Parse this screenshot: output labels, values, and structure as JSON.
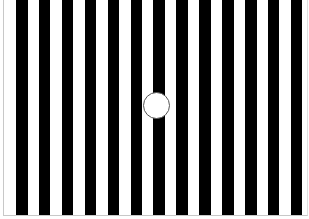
{
  "figure": {
    "stripe_color": "#000000",
    "background_color": "#ffffff",
    "stripe_width": 11.5,
    "stripe_period": 22.9,
    "stripe_count": 13,
    "first_stripe_x": 16,
    "circle": {
      "cx": 156,
      "cy": 105,
      "r": 13.5,
      "fill": "#ffffff",
      "stroke": "#555555"
    }
  }
}
